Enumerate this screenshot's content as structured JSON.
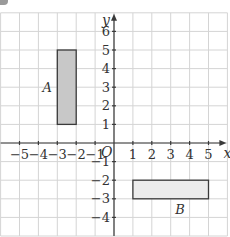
{
  "diagram": {
    "type": "coordinate-grid",
    "x_range": [
      -6,
      6
    ],
    "y_range": [
      -5,
      7
    ],
    "axes": {
      "x_label": "x",
      "y_label": "y",
      "origin_label": "O",
      "x_ticks": [
        "-5",
        "-4",
        "-3",
        "-2",
        "-1",
        "1",
        "2",
        "3",
        "4",
        "5"
      ],
      "y_ticks": [
        "6",
        "5",
        "4",
        "3",
        "2",
        "1",
        "-1",
        "-2",
        "-3",
        "-4"
      ]
    },
    "shapes": [
      {
        "label": "A",
        "x1": -3,
        "y1": 1,
        "x2": -2,
        "y2": 5,
        "fill": "#c8c8c8",
        "stroke": "#3a3a3a"
      },
      {
        "label": "B",
        "x1": 1,
        "y1": -3,
        "x2": 5,
        "y2": -2,
        "fill": "#ececec",
        "stroke": "#3a3a3a"
      }
    ],
    "colors": {
      "grid": "#d4d4d4",
      "axis": "#3a3a3a",
      "text": "#333333"
    }
  }
}
